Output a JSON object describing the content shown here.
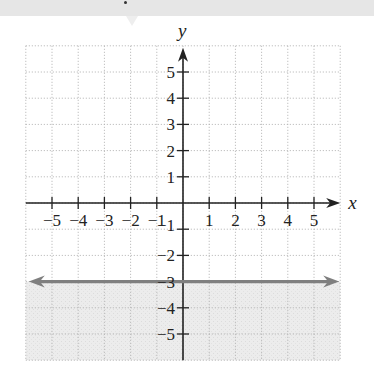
{
  "header_strip": {
    "color": "#e6e6e6"
  },
  "chart_data": {
    "type": "line",
    "title": "",
    "xlabel": "x",
    "ylabel": "y",
    "xlim": [
      -6,
      6
    ],
    "ylim": [
      -6,
      6
    ],
    "grid": true,
    "grid_style": "dotted",
    "x_ticks": [
      -5,
      -4,
      -3,
      -2,
      -1,
      1,
      2,
      3,
      4,
      5
    ],
    "y_ticks": [
      5,
      4,
      3,
      2,
      1,
      -1,
      -2,
      -3,
      -4,
      -5
    ],
    "x_tick_labels": [
      "−5",
      "−4",
      "−3",
      "−2",
      "−1",
      "1",
      "2",
      "3",
      "4",
      "5"
    ],
    "y_tick_labels": [
      "5",
      "4",
      "3",
      "2",
      "1",
      "−1",
      "−2",
      "−3",
      "−4",
      "−5"
    ],
    "series": [
      {
        "name": "y = -3",
        "kind": "horizontal-line",
        "equation": "y = -3",
        "x": [
          -6,
          6
        ],
        "y": [
          -3,
          -3
        ],
        "style": "solid",
        "arrows": "both",
        "color": "#7f7f7f"
      }
    ],
    "shaded_region": {
      "description": "y < -3",
      "inequality": "y < -3",
      "from_y": -3,
      "to_y": -6,
      "color": "#ececec"
    },
    "axis_color": "#222222",
    "grid_color": "#b0b0b0"
  }
}
